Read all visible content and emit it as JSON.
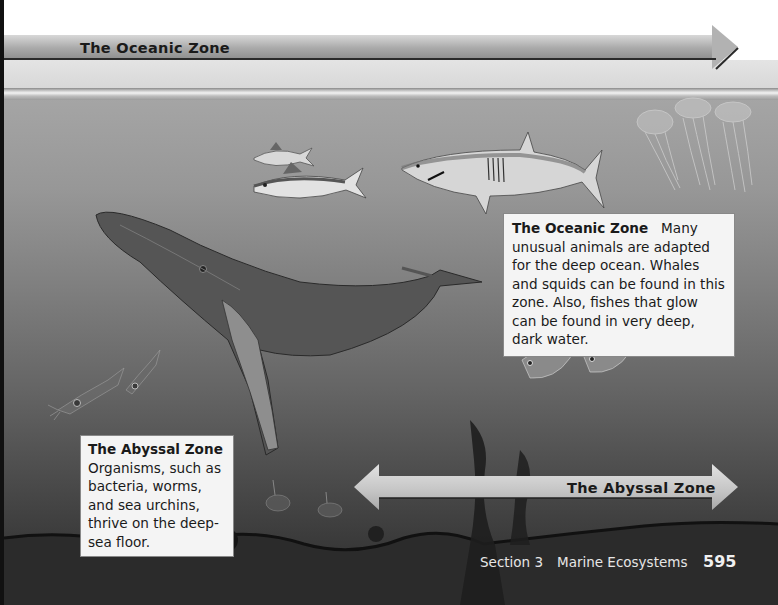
{
  "banner": {
    "oceanic_zone_label": "The Oceanic Zone"
  },
  "callouts": {
    "oceanic": {
      "title": "The Oceanic Zone",
      "body": "Many unusual animals are adapted for the deep ocean. Whales and squids can be found in this zone. Also, fishes that glow can be found in very deep, dark water."
    },
    "abyssal": {
      "title": "The Abyssal Zone",
      "body": "Organisms, such as bacteria, worms, and sea urchins, thrive on the deep-sea floor."
    }
  },
  "abyssal_arrow": {
    "label": "The Abyssal Zone"
  },
  "illustration": {
    "organisms": [
      "jellyfish",
      "tuna",
      "shark",
      "humpback-whale",
      "squid",
      "hatchetfish",
      "sea-urchin",
      "hydrothermal-vent",
      "tube-worms"
    ],
    "palette": {
      "ocean_top": "#a5a5a5",
      "ocean_bottom": "#2a2a2a",
      "callout_bg": "#f4f4f4"
    }
  },
  "footer": {
    "section": "Section 3",
    "chapter_title": "Marine Ecosystems",
    "page_number": "595"
  }
}
